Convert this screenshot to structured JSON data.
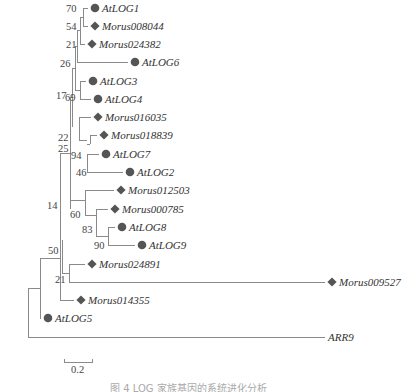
{
  "figure": {
    "type": "phylogenetic-tree",
    "marker_color": "#555555",
    "line_color": "#8a8a8a",
    "legend_markers": {
      "circle": "Arabidopsis AtLOG",
      "diamond": "Morus"
    },
    "leaves": [
      {
        "id": "AtLOG1",
        "label": "AtLOG1",
        "marker": "circle",
        "x": 95,
        "y": 8
      },
      {
        "id": "Morus008044",
        "label": "Morus008044",
        "marker": "diamond",
        "x": 95,
        "y": 26
      },
      {
        "id": "Morus024382",
        "label": "Morus024382",
        "marker": "diamond",
        "x": 92,
        "y": 44
      },
      {
        "id": "AtLOG6",
        "label": "AtLOG6",
        "marker": "circle",
        "x": 135,
        "y": 62
      },
      {
        "id": "AtLOG3",
        "label": "AtLOG3",
        "marker": "circle",
        "x": 93,
        "y": 81
      },
      {
        "id": "AtLOG4",
        "label": "AtLOG4",
        "marker": "circle",
        "x": 98,
        "y": 99
      },
      {
        "id": "Morus016035",
        "label": "Morus016035",
        "marker": "diamond",
        "x": 98,
        "y": 117
      },
      {
        "id": "Morus018839",
        "label": "Morus018839",
        "marker": "diamond",
        "x": 104,
        "y": 135
      },
      {
        "id": "AtLOG7",
        "label": "AtLOG7",
        "marker": "circle",
        "x": 106,
        "y": 154
      },
      {
        "id": "AtLOG2",
        "label": "AtLOG2",
        "marker": "circle",
        "x": 130,
        "y": 172
      },
      {
        "id": "Morus012503",
        "label": "Morus012503",
        "marker": "diamond",
        "x": 121,
        "y": 190
      },
      {
        "id": "Morus000785",
        "label": "Morus000785",
        "marker": "diamond",
        "x": 115,
        "y": 209
      },
      {
        "id": "AtLOG8",
        "label": "AtLOG8",
        "marker": "circle",
        "x": 122,
        "y": 227
      },
      {
        "id": "AtLOG9",
        "label": "AtLOG9",
        "marker": "circle",
        "x": 142,
        "y": 245
      },
      {
        "id": "Morus024891",
        "label": "Morus024891",
        "marker": "diamond",
        "x": 92,
        "y": 264
      },
      {
        "id": "Morus009527",
        "label": "Morus009527",
        "marker": "diamond",
        "x": 332,
        "y": 282
      },
      {
        "id": "Morus014355",
        "label": "Morus014355",
        "marker": "diamond",
        "x": 81,
        "y": 300
      },
      {
        "id": "AtLOG5",
        "label": "AtLOG5",
        "marker": "circle",
        "x": 48,
        "y": 318
      },
      {
        "id": "ARR9",
        "label": "ARR9",
        "marker": "none",
        "x": 325,
        "y": 337
      }
    ],
    "branches": [
      [
        83,
        8,
        88,
        8
      ],
      [
        83,
        26,
        88,
        26
      ],
      [
        83,
        8,
        83,
        26
      ],
      [
        80,
        17,
        83,
        17
      ],
      [
        80,
        44,
        85,
        44
      ],
      [
        80,
        17,
        80,
        44
      ],
      [
        77,
        30,
        80,
        30
      ],
      [
        77,
        62,
        128,
        62
      ],
      [
        77,
        30,
        77,
        62
      ],
      [
        75,
        46,
        77,
        46
      ],
      [
        80,
        81,
        86,
        81
      ],
      [
        80,
        99,
        91,
        99
      ],
      [
        80,
        81,
        80,
        99
      ],
      [
        75,
        90,
        80,
        90
      ],
      [
        75,
        46,
        75,
        90
      ],
      [
        72,
        68,
        75,
        68
      ],
      [
        79,
        117,
        91,
        117
      ],
      [
        79,
        127,
        79,
        117
      ],
      [
        72,
        68,
        72,
        127
      ],
      [
        90,
        135,
        97,
        135
      ],
      [
        90,
        135,
        90,
        144
      ],
      [
        87,
        144,
        90,
        144
      ],
      [
        87,
        154,
        99,
        154
      ],
      [
        87,
        172,
        123,
        172
      ],
      [
        87,
        154,
        87,
        172
      ],
      [
        79,
        127,
        79,
        140
      ],
      [
        79,
        140,
        87,
        140
      ],
      [
        70,
        97,
        72,
        97
      ],
      [
        70,
        97,
        70,
        209
      ],
      [
        85,
        190,
        114,
        190
      ],
      [
        85,
        190,
        85,
        215
      ],
      [
        96,
        209,
        108,
        209
      ],
      [
        96,
        209,
        96,
        236
      ],
      [
        108,
        227,
        115,
        227
      ],
      [
        108,
        245,
        135,
        245
      ],
      [
        108,
        227,
        108,
        236
      ],
      [
        108,
        236,
        108,
        245
      ],
      [
        96,
        236,
        108,
        236
      ],
      [
        85,
        215,
        96,
        215
      ],
      [
        70,
        209,
        70,
        200
      ],
      [
        70,
        200,
        85,
        200
      ],
      [
        60,
        153,
        70,
        153
      ],
      [
        69,
        264,
        85,
        264
      ],
      [
        69,
        282,
        325,
        282
      ],
      [
        69,
        264,
        69,
        282
      ],
      [
        62,
        273,
        69,
        273
      ],
      [
        60,
        153,
        60,
        300
      ],
      [
        60,
        300,
        74,
        300
      ],
      [
        62,
        273,
        62,
        240
      ],
      [
        40,
        318,
        41,
        318
      ],
      [
        40,
        258,
        40,
        318
      ],
      [
        40,
        258,
        60,
        258
      ],
      [
        40,
        318,
        41,
        318
      ],
      [
        28,
        288,
        40,
        288
      ],
      [
        28,
        288,
        28,
        337
      ],
      [
        28,
        337,
        325,
        337
      ]
    ],
    "bootstrap": [
      {
        "value": "70",
        "x": 66,
        "y": 12
      },
      {
        "value": "54",
        "x": 66,
        "y": 30
      },
      {
        "value": "21",
        "x": 66,
        "y": 48
      },
      {
        "value": "26",
        "x": 60,
        "y": 67
      },
      {
        "value": "17",
        "x": 56,
        "y": 99
      },
      {
        "value": "69",
        "x": 65,
        "y": 101
      },
      {
        "value": "22",
        "x": 58,
        "y": 141
      },
      {
        "value": "25",
        "x": 58,
        "y": 152
      },
      {
        "value": "94",
        "x": 71,
        "y": 159
      },
      {
        "value": "46",
        "x": 76,
        "y": 176
      },
      {
        "value": "14",
        "x": 47,
        "y": 209
      },
      {
        "value": "60",
        "x": 70,
        "y": 218
      },
      {
        "value": "83",
        "x": 82,
        "y": 233
      },
      {
        "value": "90",
        "x": 94,
        "y": 249
      },
      {
        "value": "50",
        "x": 48,
        "y": 254
      },
      {
        "value": "21",
        "x": 55,
        "y": 283
      }
    ],
    "scale_bar": {
      "label": "0.2",
      "x1": 64,
      "x2": 92,
      "y": 362
    },
    "caption": "图 4  LOG 家族基因的系统进化分析"
  }
}
